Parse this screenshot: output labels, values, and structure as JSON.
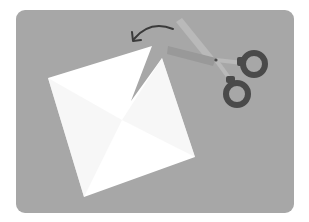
{
  "illustration": {
    "subject": "scissors cutting a corner of a square sheet of paper",
    "colors": {
      "card": "#a7a7a7",
      "paper": "#ffffff",
      "paper_shade": "#f2f2f2",
      "blade_light": "#b9b9b9",
      "blade_dark": "#999999",
      "handle": "#4a4a4a",
      "arrow": "#3a3a3a"
    },
    "icons": [
      "paper-icon",
      "scissors-icon",
      "curved-arrow-icon"
    ]
  }
}
